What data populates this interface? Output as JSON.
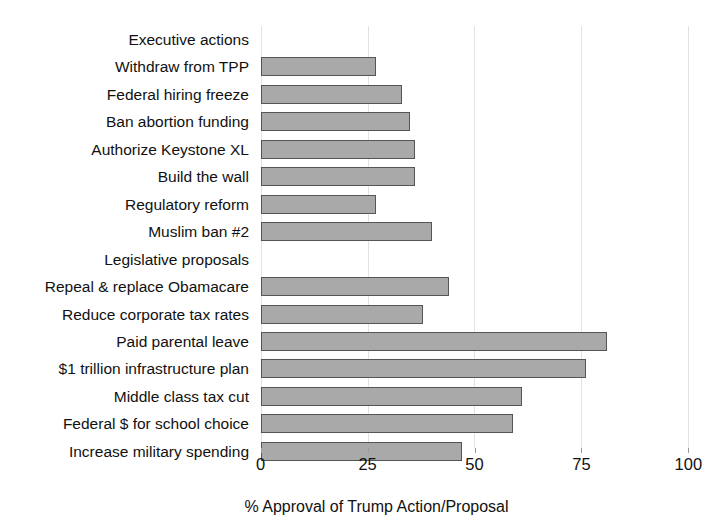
{
  "chart_data": {
    "type": "bar",
    "orientation": "horizontal",
    "title": "",
    "subtitle": "",
    "xlabel": "% Approval of Trump Action/Proposal",
    "ylabel": "",
    "xlim": [
      0,
      100
    ],
    "xticks": [
      0,
      25,
      50,
      75,
      100
    ],
    "xtick_labels": [
      "0",
      "25",
      "50",
      "75",
      "100"
    ],
    "grid": true,
    "grid_axis": "x",
    "legend": false,
    "bar_color": "#a9a9a9",
    "bar_edge_color": "#555555",
    "grid_color": "#e2e2e2",
    "categories": [
      "Executive actions",
      "Withdraw from TPP",
      "Federal hiring freeze",
      "Ban abortion funding",
      "Authorize Keystone XL",
      "Build the wall",
      "Regulatory reform",
      "Muslim ban #2",
      "Legislative proposals",
      "Repeal & replace Obamacare",
      "Reduce corporate tax rates",
      "Paid parental leave",
      "$1 trillion infrastructure plan",
      "Middle class tax cut",
      "Federal $ for school choice",
      "Increase military spending"
    ],
    "values": [
      null,
      27,
      33,
      35,
      36,
      36,
      27,
      40,
      null,
      44,
      38,
      81,
      76,
      61,
      59,
      47
    ],
    "group_headers": [
      "Executive actions",
      "Legislative proposals"
    ],
    "bars": [
      {
        "label": "Executive actions",
        "value": null,
        "is_header": true
      },
      {
        "label": "Withdraw from TPP",
        "value": 27,
        "is_header": false
      },
      {
        "label": "Federal hiring freeze",
        "value": 33,
        "is_header": false
      },
      {
        "label": "Ban abortion funding",
        "value": 35,
        "is_header": false
      },
      {
        "label": "Authorize Keystone XL",
        "value": 36,
        "is_header": false
      },
      {
        "label": "Build the wall",
        "value": 36,
        "is_header": false
      },
      {
        "label": "Regulatory reform",
        "value": 27,
        "is_header": false
      },
      {
        "label": "Muslim ban #2",
        "value": 40,
        "is_header": false
      },
      {
        "label": "Legislative proposals",
        "value": null,
        "is_header": true
      },
      {
        "label": "Repeal & replace Obamacare",
        "value": 44,
        "is_header": false
      },
      {
        "label": "Reduce corporate tax rates",
        "value": 38,
        "is_header": false
      },
      {
        "label": "Paid parental leave",
        "value": 81,
        "is_header": false
      },
      {
        "label": "$1 trillion infrastructure plan",
        "value": 76,
        "is_header": false
      },
      {
        "label": "Middle class tax cut",
        "value": 61,
        "is_header": false
      },
      {
        "label": "Federal $ for school choice",
        "value": 59,
        "is_header": false
      },
      {
        "label": "Increase military spending",
        "value": 47,
        "is_header": false
      }
    ]
  }
}
